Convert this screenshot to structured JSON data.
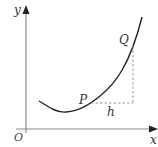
{
  "figure": {
    "type": "function-graph",
    "labels": {
      "y_axis": "y",
      "x_axis": "x",
      "origin": "O",
      "point_p": "P",
      "point_q": "Q",
      "increment": "h"
    },
    "colors": {
      "curve": "#222222",
      "axes": "#888888",
      "dashed": "#999999",
      "text": "#333333"
    }
  }
}
